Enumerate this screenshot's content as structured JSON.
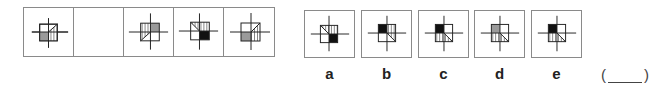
{
  "question": {
    "sequence": [
      {
        "id": "seq-1",
        "figure": "square with cross; bottom-left gray, diagonal from top-right corner to center, right part vertical stripes"
      },
      {
        "id": "seq-2",
        "figure": "empty"
      },
      {
        "id": "seq-3",
        "figure": "square with cross; top-right gray, diagonal from bottom-left corner to center, top-left vertical stripes"
      },
      {
        "id": "seq-4",
        "figure": "square with cross; bottom-right black, diagonal from top-left corner to center, top-right vertical stripes"
      },
      {
        "id": "seq-5",
        "figure": "square with cross; bottom-left gray, diagonal from top-right corner to center, right part vertical stripes"
      }
    ],
    "options": [
      {
        "label": "a"
      },
      {
        "label": "b"
      },
      {
        "label": "c"
      },
      {
        "label": "d"
      },
      {
        "label": "e"
      }
    ],
    "answer": {
      "open": "(",
      "close": ")"
    },
    "colors": {
      "gray": "#9a9a9a",
      "black": "#111111",
      "stroke": "#222222",
      "frame": "#8a8a8a"
    }
  }
}
